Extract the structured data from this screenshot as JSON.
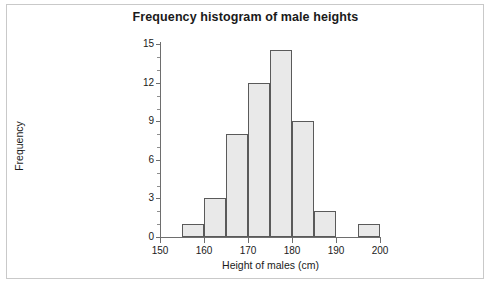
{
  "chart_data": {
    "type": "bar",
    "title": "Frequency histogram of male heights",
    "xlabel": "Height of males (cm)",
    "ylabel": "Frequency",
    "xlim": [
      150,
      200
    ],
    "ylim": [
      0,
      15
    ],
    "xticks": [
      150,
      160,
      170,
      180,
      190,
      200
    ],
    "yticks": [
      0,
      3,
      6,
      9,
      12,
      15
    ],
    "grid": false,
    "legend": null,
    "bin_width": 5,
    "bin_edges": [
      155,
      160,
      165,
      170,
      175,
      180,
      185,
      190,
      195,
      200
    ],
    "categories": [
      "155-160",
      "160-165",
      "165-170",
      "170-175",
      "175-180",
      "180-185",
      "185-190",
      "190-195",
      "195-200"
    ],
    "values": [
      1,
      3,
      8,
      12,
      14.5,
      9,
      2,
      0,
      1
    ],
    "bars": [
      {
        "start": 155,
        "end": 160,
        "value": 1
      },
      {
        "start": 160,
        "end": 165,
        "value": 3
      },
      {
        "start": 165,
        "end": 170,
        "value": 8
      },
      {
        "start": 170,
        "end": 175,
        "value": 12
      },
      {
        "start": 175,
        "end": 180,
        "value": 14.5
      },
      {
        "start": 180,
        "end": 185,
        "value": 9
      },
      {
        "start": 185,
        "end": 190,
        "value": 2
      },
      {
        "start": 190,
        "end": 195,
        "value": 0
      },
      {
        "start": 195,
        "end": 200,
        "value": 1
      }
    ],
    "bar_fill_color": "#e9e9e9",
    "bar_edge_color": "#5a5a5a",
    "axis_color": "#6e6e6e",
    "background_color": "#ffffff"
  },
  "axis": {
    "y_tick_labels": [
      "0",
      "3",
      "6",
      "9",
      "12",
      "15"
    ],
    "x_tick_labels": [
      "150",
      "160",
      "170",
      "180",
      "190",
      "200"
    ]
  }
}
